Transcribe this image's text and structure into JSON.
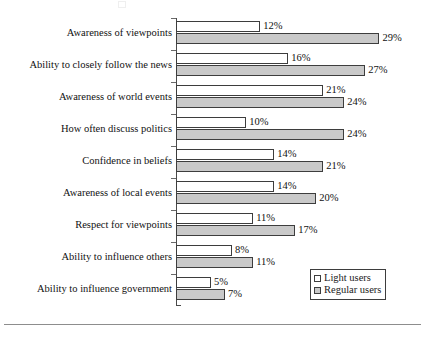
{
  "chart_data": {
    "type": "bar",
    "orientation": "horizontal",
    "title": "",
    "subtitle": "",
    "xlabel": "",
    "ylabel": "",
    "xlim": [
      0,
      30
    ],
    "grid": false,
    "legend_position": "bottom-right",
    "value_suffix": "%",
    "categories": [
      "Awareness of viewpoints",
      "Ability to closely follow the news",
      "Awareness of world events",
      "How often discuss politics",
      "Confidence in beliefs",
      "Awareness of local events",
      "Respect for viewpoints",
      "Ability to influence others",
      "Ability to influence government"
    ],
    "series": [
      {
        "name": "Light users",
        "color": "#ffffff",
        "values": [
          12,
          16,
          21,
          10,
          14,
          14,
          11,
          8,
          5
        ],
        "labels": [
          "12%",
          "16%",
          "21%",
          "10%",
          "14%",
          "14%",
          "11%",
          "8%",
          "5%"
        ]
      },
      {
        "name": "Regular users",
        "color": "#c9c9c9",
        "values": [
          29,
          27,
          24,
          24,
          21,
          20,
          17,
          11,
          7
        ],
        "labels": [
          "29%",
          "27%",
          "24%",
          "24%",
          "21%",
          "20%",
          "17%",
          "11%",
          "7%"
        ]
      }
    ]
  },
  "legend": {
    "items": [
      {
        "label": "Light users",
        "swatch": "light"
      },
      {
        "label": "Regular users",
        "swatch": "regular"
      }
    ]
  }
}
